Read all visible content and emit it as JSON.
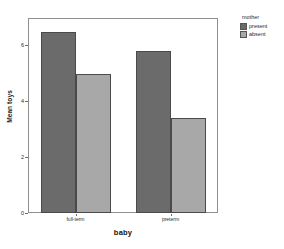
{
  "chart_data": {
    "type": "bar",
    "title": "",
    "xlabel": "baby",
    "ylabel": "Mean toys",
    "categories": [
      "full-term",
      "preterm"
    ],
    "series": [
      {
        "name": "present",
        "values": [
          6.5,
          5.8
        ],
        "color": "#6b6b6b"
      },
      {
        "name": "absent",
        "values": [
          5.0,
          3.4
        ],
        "color": "#a8a8a8"
      }
    ],
    "ylim": [
      0,
      7
    ],
    "yticks": [
      0,
      2,
      4,
      6
    ],
    "ytick_labels": [
      "0",
      "2",
      "4",
      "6"
    ],
    "grid": false,
    "legend": {
      "title": "mother",
      "position": "right",
      "entries": [
        "present",
        "absent"
      ]
    }
  },
  "axes": {
    "y_title": "Mean toys",
    "x_title": "baby",
    "y_tick_labels": [
      "6",
      "4",
      "2",
      "0"
    ],
    "x_tick_labels": [
      "full-term",
      "preterm"
    ]
  },
  "legend": {
    "title": "mother",
    "items": [
      {
        "label": "present",
        "color": "#6b6b6b"
      },
      {
        "label": "absent",
        "color": "#a8a8a8"
      }
    ]
  }
}
